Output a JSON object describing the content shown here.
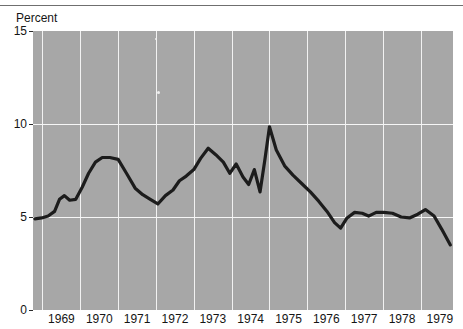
{
  "chart_data": {
    "type": "line",
    "title": "",
    "subtitle": "",
    "ylabel": "Percent",
    "xlabel": "",
    "ylim": [
      0,
      15
    ],
    "xlim": [
      1968.75,
      1979.85
    ],
    "yticks": [
      0,
      5,
      10,
      15
    ],
    "ytick_labels": [
      "0",
      "5",
      "10",
      "15"
    ],
    "xticks": [
      1969,
      1970,
      1971,
      1972,
      1973,
      1974,
      1975,
      1976,
      1977,
      1978,
      1979
    ],
    "xtick_labels": [
      "1969",
      "1970",
      "1971",
      "1972",
      "1973",
      "1974",
      "1975",
      "1976",
      "1977",
      "1978",
      "1979"
    ],
    "grid": true,
    "grid_color": "#f2f2f2",
    "plot_background": "#a7a7a7",
    "line_color": "#1c1c1c",
    "line_width": 3.2,
    "legend": null,
    "legend_position": "none",
    "series": [
      {
        "name": "Percent",
        "x": [
          1968.8,
          1968.98,
          1969.15,
          1969.32,
          1969.45,
          1969.58,
          1969.72,
          1969.88,
          1970.05,
          1970.22,
          1970.4,
          1970.58,
          1970.78,
          1971.0,
          1971.22,
          1971.45,
          1971.65,
          1971.85,
          1972.05,
          1972.25,
          1972.45,
          1972.62,
          1972.8,
          1973.0,
          1973.18,
          1973.38,
          1973.58,
          1973.78,
          1973.95,
          1974.12,
          1974.3,
          1974.45,
          1974.6,
          1974.75,
          1974.88,
          1975.0,
          1975.18,
          1975.4,
          1975.62,
          1975.85,
          1976.08,
          1976.3,
          1976.52,
          1976.72,
          1976.88,
          1977.05,
          1977.25,
          1977.45,
          1977.62,
          1977.82,
          1978.02,
          1978.25,
          1978.48,
          1978.7,
          1978.92,
          1979.12,
          1979.35,
          1979.55,
          1979.78
        ],
        "y": [
          4.9,
          4.95,
          5.05,
          5.3,
          5.95,
          6.15,
          5.9,
          5.95,
          6.6,
          7.35,
          7.95,
          8.2,
          8.2,
          8.1,
          7.35,
          6.55,
          6.2,
          5.95,
          5.7,
          6.15,
          6.45,
          6.95,
          7.2,
          7.55,
          8.15,
          8.7,
          8.35,
          7.95,
          7.35,
          7.85,
          7.15,
          6.75,
          7.55,
          6.35,
          8.1,
          9.85,
          8.6,
          7.75,
          7.25,
          6.8,
          6.35,
          5.85,
          5.3,
          4.7,
          4.4,
          4.95,
          5.25,
          5.2,
          5.05,
          5.25,
          5.25,
          5.2,
          5.0,
          4.95,
          5.15,
          5.4,
          5.05,
          4.35,
          3.5
        ]
      }
    ],
    "annotations": []
  }
}
